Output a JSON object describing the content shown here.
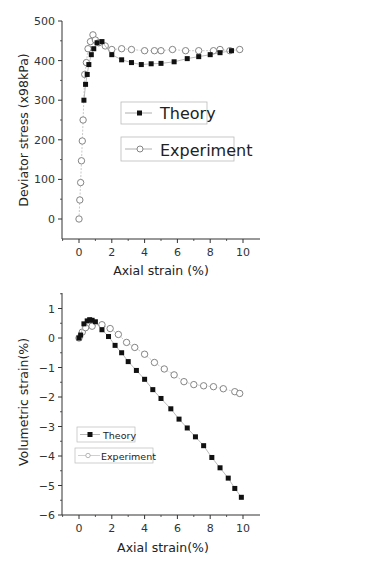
{
  "chart_data": [
    {
      "type": "scatter",
      "title": "",
      "xlabel": "Axial strain (%)",
      "ylabel": "Deviator stress (x98kPa)",
      "xlim": [
        -1,
        11
      ],
      "ylim": [
        -50,
        500
      ],
      "xticks": [
        0,
        2,
        4,
        6,
        8,
        10
      ],
      "yticks": [
        0,
        100,
        200,
        300,
        400,
        500
      ],
      "grid": false,
      "legend_position": "center-right",
      "series": [
        {
          "name": "Theory",
          "marker": "filled-square",
          "x": [
            0.3,
            0.4,
            0.5,
            0.6,
            0.75,
            0.9,
            1.1,
            1.4,
            2.0,
            2.6,
            3.2,
            3.8,
            4.4,
            5.0,
            5.8,
            6.6,
            7.3,
            8.0,
            8.6,
            9.3
          ],
          "y": [
            300,
            340,
            365,
            390,
            415,
            430,
            445,
            448,
            415,
            402,
            395,
            390,
            392,
            393,
            397,
            405,
            410,
            415,
            420,
            425
          ]
        },
        {
          "name": "Experiment",
          "marker": "open-circle",
          "x": [
            0.0,
            0.05,
            0.1,
            0.15,
            0.2,
            0.25,
            0.35,
            0.45,
            0.55,
            0.7,
            0.85,
            1.0,
            1.2,
            1.6,
            2.0,
            2.6,
            3.2,
            4.0,
            4.6,
            5.0,
            5.7,
            6.5,
            7.3,
            8.2,
            8.6,
            9.2,
            9.8
          ],
          "y": [
            0,
            48,
            92,
            147,
            197,
            250,
            365,
            395,
            430,
            448,
            465,
            452,
            445,
            437,
            428,
            430,
            428,
            425,
            425,
            425,
            428,
            425,
            425,
            425,
            428,
            425,
            428
          ]
        }
      ]
    },
    {
      "type": "scatter",
      "title": "",
      "xlabel": "Axial strain(%)",
      "ylabel": "Volumetric strain(%)",
      "xlim": [
        -1,
        11
      ],
      "ylim": [
        -6,
        1.5
      ],
      "xticks": [
        0,
        2,
        4,
        6,
        8,
        10
      ],
      "yticks": [
        1,
        0,
        -1,
        -2,
        -3,
        -4,
        -5,
        -6
      ],
      "grid": false,
      "legend_position": "lower-left",
      "series": [
        {
          "name": "Theory",
          "marker": "filled-square",
          "x": [
            0.0,
            0.1,
            0.3,
            0.5,
            0.65,
            0.8,
            1.0,
            1.4,
            1.8,
            2.2,
            2.6,
            3.0,
            3.5,
            4.0,
            4.5,
            5.0,
            5.6,
            6.1,
            6.6,
            7.1,
            7.6,
            8.1,
            8.6,
            9.1,
            9.5,
            9.9
          ],
          "y": [
            0.0,
            0.1,
            0.48,
            0.58,
            0.62,
            0.6,
            0.55,
            0.28,
            0.05,
            -0.25,
            -0.5,
            -0.8,
            -1.1,
            -1.4,
            -1.75,
            -2.05,
            -2.4,
            -2.75,
            -3.05,
            -3.35,
            -3.65,
            -4.05,
            -4.4,
            -4.75,
            -5.1,
            -5.4
          ]
        },
        {
          "name": "Experiment",
          "marker": "open-circle",
          "x": [
            0.0,
            0.2,
            0.4,
            0.8,
            1.4,
            1.9,
            2.4,
            2.9,
            3.4,
            4.0,
            4.6,
            5.2,
            5.8,
            6.4,
            7.0,
            7.6,
            8.2,
            8.8,
            9.5,
            9.8
          ],
          "y": [
            0.0,
            0.2,
            0.35,
            0.4,
            0.45,
            0.32,
            0.12,
            -0.15,
            -0.32,
            -0.55,
            -0.83,
            -1.05,
            -1.25,
            -1.48,
            -1.58,
            -1.62,
            -1.65,
            -1.72,
            -1.82,
            -1.88
          ]
        }
      ]
    }
  ],
  "charts": {
    "top": {
      "ylabel": "Deviator stress (x98kPa)",
      "xlabel": "Axial strain (%)",
      "yticks": [
        "500",
        "400",
        "300",
        "200",
        "100",
        "0"
      ],
      "xticks": [
        "0",
        "2",
        "4",
        "6",
        "8",
        "10"
      ],
      "legend": [
        "Theory",
        "Experiment"
      ]
    },
    "bottom": {
      "ylabel": "Volumetric strain(%)",
      "xlabel": "Axial strain(%)",
      "yticks": [
        "1",
        "0",
        "-1",
        "-2",
        "-3",
        "-4",
        "-5",
        "-6"
      ],
      "xticks": [
        "0",
        "2",
        "4",
        "6",
        "8",
        "10"
      ],
      "legend": [
        "Theory",
        "Experiment"
      ]
    }
  }
}
